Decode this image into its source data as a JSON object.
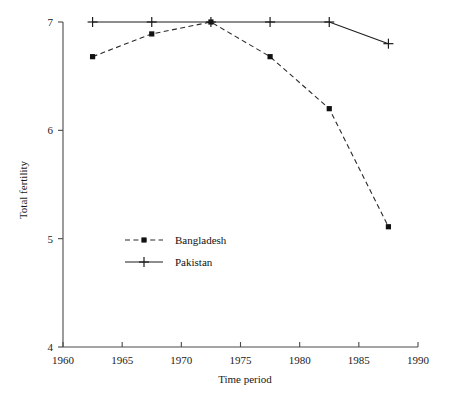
{
  "chart_data": {
    "type": "line",
    "title": "",
    "xlabel": "Time period",
    "ylabel": "Total fertility",
    "xlim": [
      1960,
      1990
    ],
    "ylim": [
      4,
      7
    ],
    "xticks": [
      1960,
      1965,
      1970,
      1975,
      1980,
      1985,
      1990
    ],
    "xticklabels": [
      "1960",
      "1965",
      "1970",
      "1975",
      "1980",
      "1985",
      "1990"
    ],
    "yticks": [
      4,
      5,
      6,
      7
    ],
    "yticklabels": [
      "4",
      "5",
      "6",
      "7"
    ],
    "grid": false,
    "legend_position": "center-left",
    "x": [
      1962.5,
      1967.5,
      1972.5,
      1977.5,
      1982.5,
      1987.5
    ],
    "series": [
      {
        "name": "Bangladesh",
        "marker": "filled-square",
        "linestyle": "dashed",
        "color": "#1c1c1c",
        "values": [
          6.68,
          6.89,
          7.0,
          6.68,
          6.2,
          5.11
        ]
      },
      {
        "name": "Pakistan",
        "marker": "plus",
        "linestyle": "solid",
        "color": "#1c1c1c",
        "values": [
          7.0,
          7.0,
          7.0,
          7.0,
          7.0,
          6.8
        ]
      }
    ]
  },
  "legend": {
    "entries": [
      {
        "label": "Bangladesh"
      },
      {
        "label": "Pakistan"
      }
    ]
  },
  "axes": {
    "x_title": "Time period",
    "y_title": "Total fertility"
  }
}
